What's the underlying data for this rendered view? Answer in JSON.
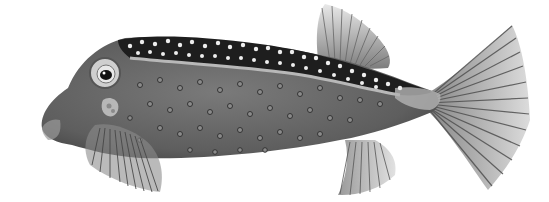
{
  "image": {
    "subject": "Boxfish illustration",
    "description": "Grayscale scientific illustration of a spotted boxfish facing left, with a dark dorsal band covered in white dots, a gray body with dark-ringed spots, fan-like dorsal, pectoral, anal and caudal fins.",
    "colors": {
      "background": "#ffffff",
      "body": "#6e6e6e",
      "body_dark": "#4a4a4a",
      "dorsal_band": "#1e1e1e",
      "band_edge": "#b8b8b8",
      "fin": "#9a9a9a",
      "fin_ray": "#555555",
      "spot_light": "#e8e8e8",
      "spot_ring": "#3a3a3a"
    }
  }
}
